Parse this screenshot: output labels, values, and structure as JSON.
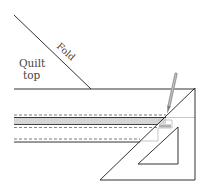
{
  "diagram": {
    "type": "quilt-binding-marking-illustration",
    "labels": {
      "quilt_top_line1": "Quilt",
      "quilt_top_line2": "top",
      "fold": "Fold"
    },
    "colors": {
      "line": "#333333",
      "light_line": "#b8b8b8",
      "band_fill": "#d6d6d6",
      "pencil": "#9a9a9a",
      "text": "#444444"
    },
    "elements": [
      {
        "name": "fold-line",
        "from": [
          14,
          15
        ],
        "to": [
          91,
          89
        ]
      },
      {
        "name": "quilt-top-edge",
        "from": [
          14,
          89
        ],
        "to": [
          195,
          89
        ]
      },
      {
        "name": "binding-strip",
        "y_range": [
          115,
          142
        ]
      },
      {
        "name": "right-triangle-ruler",
        "points": [
          [
            195,
            88
          ],
          [
            195,
            180
          ],
          [
            100,
            180
          ]
        ]
      },
      {
        "name": "triangle-cutout",
        "points": [
          [
            178,
            127
          ],
          [
            178,
            164
          ],
          [
            138,
            164
          ]
        ]
      },
      {
        "name": "pencil",
        "from": [
          176,
          74
        ],
        "to": [
          167,
          113
        ]
      }
    ]
  }
}
